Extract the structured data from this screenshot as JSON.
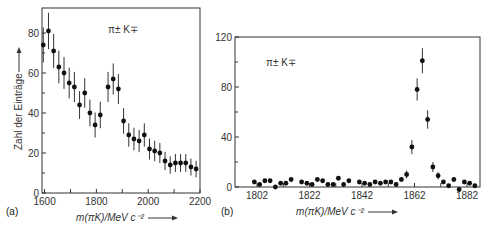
{
  "chart_data": [
    {
      "panel": "(a)",
      "type": "scatter",
      "annotation": "π± K∓",
      "xlabel": "m(πK)/MeV c⁻²",
      "ylabel": "Zahl der Einträge",
      "xlim": [
        1590,
        2200
      ],
      "ylim": [
        0,
        95
      ],
      "xticks": [
        1600,
        1800,
        2000,
        2200
      ],
      "yticks": [
        0,
        20,
        40,
        60,
        80
      ],
      "grid": false,
      "error_bars": true,
      "x": [
        1595,
        1615,
        1635,
        1655,
        1675,
        1695,
        1715,
        1735,
        1755,
        1775,
        1795,
        1815,
        1845,
        1865,
        1885,
        1905,
        1925,
        1945,
        1965,
        1985,
        2005,
        2025,
        2045,
        2065,
        2085,
        2105,
        2125,
        2145,
        2165,
        2185
      ],
      "values": [
        74,
        81,
        71,
        63,
        60,
        55,
        53,
        44,
        50,
        40,
        34,
        39,
        53,
        57,
        52,
        36,
        29,
        27,
        26,
        29,
        22,
        21,
        20,
        16,
        14,
        15,
        15,
        15,
        13,
        12
      ]
    },
    {
      "panel": "(b)",
      "type": "scatter",
      "annotation": "π± K∓",
      "xlabel": "m(πK)/MeV c⁻²",
      "ylabel": "",
      "xlim": [
        1795,
        1890
      ],
      "ylim": [
        0,
        120
      ],
      "xticks": [
        1802,
        1822,
        1842,
        1862,
        1882
      ],
      "yticks": [
        0,
        40,
        80,
        120
      ],
      "grid": false,
      "error_bars": true,
      "x": [
        1801,
        1803,
        1805,
        1807,
        1809,
        1811,
        1813,
        1815,
        1819,
        1821,
        1823,
        1825,
        1827,
        1829,
        1831,
        1833,
        1835,
        1837,
        1841,
        1843,
        1845,
        1847,
        1849,
        1851,
        1853,
        1855,
        1857,
        1859,
        1861,
        1863,
        1865,
        1867,
        1869,
        1871,
        1873,
        1875,
        1877,
        1879,
        1881,
        1883,
        1885
      ],
      "values": [
        4,
        2,
        5,
        5,
        0,
        3,
        3,
        6,
        4,
        3,
        2,
        6,
        5,
        2,
        2,
        7,
        2,
        5,
        4,
        3,
        2,
        4,
        3,
        4,
        4,
        2,
        6,
        10,
        32,
        78,
        101,
        54,
        16,
        9,
        4,
        1,
        6,
        -2,
        4,
        3,
        1
      ]
    }
  ],
  "labels": {
    "panel_a": "(a)",
    "panel_b": "(b)"
  }
}
